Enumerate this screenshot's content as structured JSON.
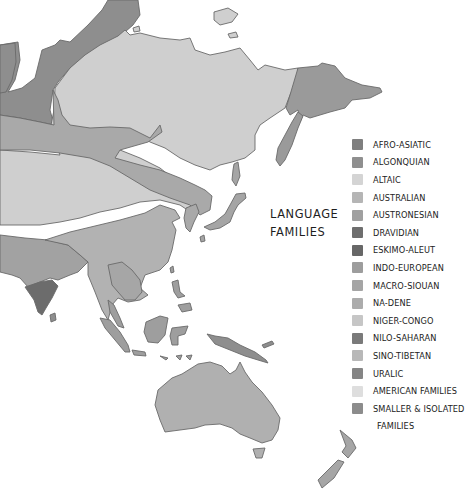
{
  "map": {
    "title_line1": "Language",
    "title_line2": "Families",
    "region_colors": {
      "uralic": "#8e8e8e",
      "altaic": "#cfcfcf",
      "indo_european": "#a2a2a2",
      "sino_tibetan": "#b2b2b2",
      "dravidian": "#6c6c6c",
      "austronesian": "#9e9e9e",
      "australian": "#b0b0b0",
      "chukotko": "#9a9a9a",
      "eskimo": "#8a8a8a",
      "smaller": "#a6a6a6",
      "band": "#a9a9a9"
    }
  },
  "legend": {
    "items": [
      {
        "label": "Afro-Asiatic",
        "color": "#7f7f7f"
      },
      {
        "label": "Algonquian",
        "color": "#8f8f8f"
      },
      {
        "label": "Altaic",
        "color": "#d4d4d4"
      },
      {
        "label": "Australian",
        "color": "#b5b5b5"
      },
      {
        "label": "Austronesian",
        "color": "#a0a0a0"
      },
      {
        "label": "Dravidian",
        "color": "#6e6e6e"
      },
      {
        "label": "Eskimo-Aleut",
        "color": "#676767"
      },
      {
        "label": "Indo-European",
        "color": "#9d9d9d"
      },
      {
        "label": "Macro-Siouan",
        "color": "#a5a5a5"
      },
      {
        "label": "Na-Dene",
        "color": "#acacac"
      },
      {
        "label": "Niger-Congo",
        "color": "#c6c6c6"
      },
      {
        "label": "Nilo-Saharan",
        "color": "#7a7a7a"
      },
      {
        "label": "Sino-Tibetan",
        "color": "#b8b8b8"
      },
      {
        "label": "Uralic",
        "color": "#858585"
      },
      {
        "label": "American Families",
        "color": "#dedede"
      },
      {
        "label": "Smaller & Isolated",
        "color": "#8c8c8c"
      }
    ],
    "continuation": "Families"
  }
}
